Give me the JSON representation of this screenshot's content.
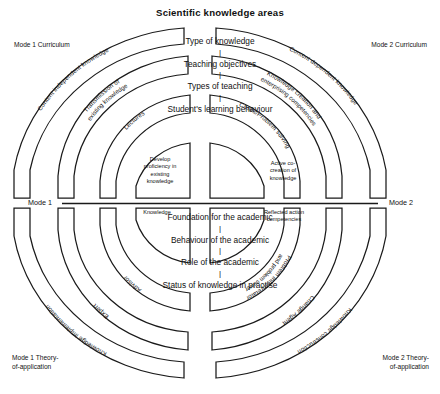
{
  "title": "Scientific knowledge areas",
  "axis": {
    "left_label": "Mode 1",
    "right_label": "Mode 2"
  },
  "corners": {
    "top_left": "Mode 1 Curriculum",
    "top_right": "Mode 2 Curriculum",
    "bottom_left": "Mode 1 Theory-of-application",
    "bottom_right": "Mode 2 Theory-of-application"
  },
  "center_top": [
    "Type of knowledge",
    "Teaching objectives",
    "Types of teaching",
    "Student's learning behaviour"
  ],
  "center_bottom": [
    "Foundation for the academic",
    "Behaviour of the academic",
    "Role of the academic",
    "Status of knowledge in practise"
  ],
  "quadrants": {
    "top_left": {
      "name": "Mode 1 Curriculum",
      "rings": [
        "Content independent knowledge",
        "Transmission of existing knowledge",
        "Lectures"
      ],
      "core": "Develop proficiency in existing knowledge"
    },
    "top_right": {
      "name": "Mode 2 Curriculum",
      "rings": [
        "Content dependent knowledge",
        "Knowledge creation and enterprising competencies",
        "Cases/Problem solving"
      ],
      "core": "Active co-creation of knowledge"
    },
    "bottom_left": {
      "name": "Mode 1 Theory-of-application",
      "rings": [
        "Knowledge implementation",
        "Expert",
        "Advisor"
      ],
      "core": "Knowledge"
    },
    "bottom_right": {
      "name": "Mode 2 Theory-of-application",
      "rings": [
        "Knowledge construction",
        "Change Agent",
        "Problem interpretator and problem solver"
      ],
      "core": "Reflected action competencies"
    }
  },
  "colors": {
    "stroke": "#1a1a1a",
    "fill": "#ffffff",
    "text": "#111111",
    "background": "#ffffff"
  }
}
